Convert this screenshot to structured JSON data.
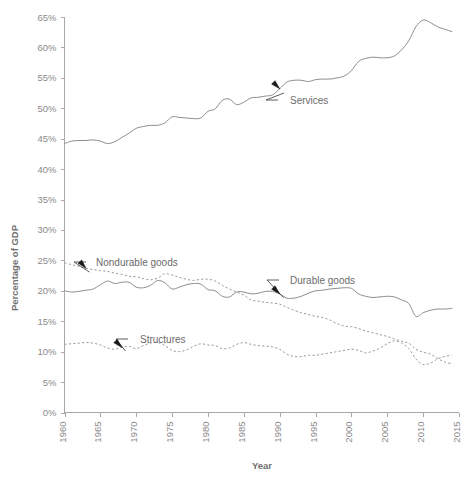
{
  "chart_data": {
    "type": "line",
    "title": "",
    "xlabel": "Year",
    "ylabel": "Percentage of GDP",
    "xlim": [
      1960,
      2015
    ],
    "ylim": [
      0,
      65
    ],
    "grid": false,
    "legend_position": "inline-annotations",
    "xticks": [
      "1960",
      "1965",
      "1970",
      "1975",
      "1980",
      "1985",
      "1990",
      "1995",
      "2000",
      "2005",
      "2010",
      "2015"
    ],
    "yticks": [
      "0%",
      "5%",
      "10%",
      "15%",
      "20%",
      "25%",
      "30%",
      "35%",
      "40%",
      "45%",
      "50%",
      "55%",
      "60%",
      "65%"
    ],
    "x": [
      1960,
      1961,
      1962,
      1963,
      1964,
      1965,
      1966,
      1967,
      1968,
      1969,
      1970,
      1971,
      1972,
      1973,
      1974,
      1975,
      1976,
      1977,
      1978,
      1979,
      1980,
      1981,
      1982,
      1983,
      1984,
      1985,
      1986,
      1987,
      1988,
      1989,
      1990,
      1991,
      1992,
      1993,
      1994,
      1995,
      1996,
      1997,
      1998,
      1999,
      2000,
      2001,
      2002,
      2003,
      2004,
      2005,
      2006,
      2007,
      2008,
      2009,
      2010,
      2011,
      2012,
      2013,
      2014
    ],
    "series": [
      {
        "name": "Services",
        "style": "solid",
        "color": "#8d8d8d",
        "values": [
          44.2,
          44.6,
          44.7,
          44.7,
          44.8,
          44.6,
          44.2,
          44.5,
          45.2,
          45.9,
          46.7,
          47.0,
          47.2,
          47.2,
          47.6,
          48.6,
          48.5,
          48.4,
          48.3,
          48.4,
          49.5,
          49.9,
          51.3,
          51.5,
          50.6,
          51.0,
          51.7,
          51.8,
          52.0,
          52.2,
          53.2,
          54.3,
          54.6,
          54.6,
          54.4,
          54.7,
          54.8,
          54.8,
          55.0,
          55.3,
          56.2,
          57.7,
          58.2,
          58.4,
          58.3,
          58.3,
          58.6,
          59.6,
          61.1,
          63.4,
          64.5,
          64.1,
          63.4,
          63.0,
          62.6
        ]
      },
      {
        "name": "Nondurable goods",
        "style": "dotted",
        "color": "#9a9a9a",
        "values": [
          24.6,
          24.3,
          24.0,
          23.7,
          23.5,
          23.3,
          23.2,
          22.9,
          22.7,
          22.4,
          22.3,
          22.0,
          21.8,
          22.1,
          22.8,
          22.6,
          22.2,
          21.9,
          21.7,
          21.9,
          21.9,
          21.6,
          20.9,
          20.3,
          19.8,
          19.3,
          18.5,
          18.3,
          18.1,
          18.0,
          17.8,
          17.3,
          16.8,
          16.4,
          16.1,
          15.8,
          15.6,
          15.2,
          14.6,
          14.2,
          14.1,
          13.8,
          13.4,
          13.1,
          12.8,
          12.5,
          12.1,
          11.7,
          11.4,
          10.4,
          9.9,
          9.6,
          8.9,
          8.3,
          8.0
        ]
      },
      {
        "name": "Durable goods",
        "style": "solid",
        "color": "#8d8d8d",
        "values": [
          20.0,
          19.8,
          19.9,
          20.1,
          20.3,
          21.0,
          21.6,
          21.2,
          21.4,
          21.4,
          20.6,
          20.5,
          20.9,
          21.7,
          21.3,
          20.3,
          20.6,
          21.0,
          21.2,
          21.1,
          20.2,
          20.0,
          19.1,
          19.0,
          19.8,
          19.8,
          19.5,
          19.6,
          19.9,
          19.9,
          19.5,
          18.8,
          18.8,
          19.1,
          19.6,
          20.0,
          20.1,
          20.3,
          20.4,
          20.5,
          20.4,
          19.5,
          19.1,
          18.9,
          19.0,
          19.1,
          19.0,
          18.5,
          17.9,
          15.8,
          16.4,
          16.8,
          17.0,
          17.0,
          17.1
        ]
      },
      {
        "name": "Structures",
        "style": "dotted",
        "color": "#9a9a9a",
        "values": [
          11.2,
          11.3,
          11.4,
          11.5,
          11.4,
          11.1,
          10.6,
          10.4,
          10.7,
          10.9,
          10.5,
          11.0,
          11.4,
          11.5,
          11.0,
          10.2,
          10.0,
          10.3,
          10.9,
          11.3,
          11.1,
          11.0,
          10.5,
          10.6,
          11.2,
          11.5,
          11.2,
          11.0,
          10.9,
          10.8,
          10.4,
          9.6,
          9.2,
          9.2,
          9.4,
          9.4,
          9.6,
          9.8,
          10.0,
          10.2,
          10.4,
          10.2,
          9.8,
          10.1,
          10.6,
          11.3,
          11.8,
          11.4,
          10.5,
          8.8,
          7.9,
          8.1,
          8.8,
          9.2,
          9.4
        ]
      }
    ],
    "annotations": [
      {
        "text": "Services",
        "series": "Services",
        "point_year": 1990
      },
      {
        "text": "Nondurable goods",
        "series": "Nondurable goods",
        "point_year": 1963
      },
      {
        "text": "Durable goods",
        "series": "Durable goods",
        "point_year": 1990
      },
      {
        "text": "Structures",
        "series": "Structures",
        "point_year": 1968
      }
    ],
    "colors": {
      "axis": "#a8a8a8",
      "tick_text": "#8a8a8a",
      "axis_title": "#6f6f6f",
      "label_text": "#6b6b6b",
      "background": "#ffffff"
    }
  }
}
